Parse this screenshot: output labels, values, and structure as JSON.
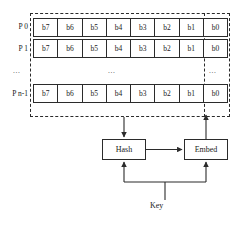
{
  "figure": {
    "colors": {
      "ink": "#1a1a1a",
      "stroke": "#2b2b2b",
      "background": "#ffffff"
    }
  },
  "bit_table": {
    "columns": [
      "b7",
      "b6",
      "b5",
      "b4",
      "b3",
      "b2",
      "b1",
      "b0"
    ],
    "rows": [
      {
        "label": "P 0",
        "cells": [
          "b7",
          "b6",
          "b5",
          "b4",
          "b3",
          "b2",
          "b1",
          "b0"
        ]
      },
      {
        "label": "P 1",
        "cells": [
          "b7",
          "b6",
          "b5",
          "b4",
          "b3",
          "b2",
          "b1",
          "b0"
        ]
      },
      {
        "label": "P n-1",
        "cells": [
          "b7",
          "b6",
          "b5",
          "b4",
          "b3",
          "b2",
          "b1",
          "b0"
        ]
      }
    ],
    "ellipsis": {
      "left": "...",
      "center": "...",
      "right": "..."
    }
  },
  "blocks": {
    "hash": "Hash",
    "embed": "Embed"
  },
  "labels": {
    "key": "Key"
  }
}
